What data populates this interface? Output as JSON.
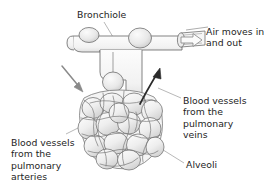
{
  "diagram": {
    "background_color": "#ffffff",
    "text_color": "#242424",
    "outline_color": "#6e6e6e",
    "fill_color": "#ededed",
    "shade_color": "#d8d8d8",
    "capillary_color": "#7a7a7a",
    "dark_arrow_color": "#2b2b2b",
    "gray_arrow_color": "#8a8a8a",
    "leader_color": "#9a9a9a"
  },
  "labels": {
    "bronchiole": {
      "name": "Bronchiole",
      "lines": [
        "Bronchiole"
      ]
    },
    "air_movement": {
      "name": "Air moves in and out",
      "lines": [
        "Air moves in",
        "and out"
      ],
      "line1": "Air moves in",
      "line2": "and out"
    },
    "pulmonary_veins": {
      "name": "Blood vessels from the pulmonary veins",
      "lines": [
        "Blood vessels",
        "from the",
        "pulmonary",
        "veins"
      ],
      "line1": "Blood vessels",
      "line2": "from the",
      "line3": "pulmonary",
      "line4": "veins"
    },
    "pulmonary_arteries": {
      "name": "Blood vessels from the pulmonary arteries",
      "lines": [
        "Blood vessels",
        "from the",
        "pulmonary",
        "arteries"
      ],
      "line1": "Blood vessels",
      "line2": "from the",
      "line3": "pulmonary",
      "line4": "arteries"
    },
    "alveoli": {
      "name": "Alveoli",
      "lines": [
        "Alveoli"
      ]
    }
  },
  "arrows": {
    "air_flow": {
      "name": "air-flow-arrow",
      "style": "hollow-outline",
      "direction": "right",
      "meaning": "Air moves in and out"
    },
    "artery_inflow": {
      "name": "pulmonary-artery-arrow",
      "style": "solid-gray",
      "direction": "down-right",
      "meaning": "Blood in from pulmonary arteries"
    },
    "vein_outflow": {
      "name": "pulmonary-vein-arrow",
      "style": "solid-dark",
      "direction": "up-right",
      "meaning": "Blood out to pulmonary veins"
    }
  }
}
